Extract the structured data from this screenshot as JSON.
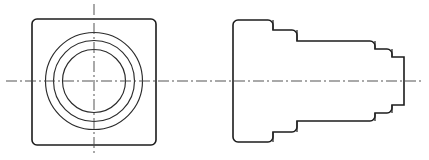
{
  "document": {
    "type": "engineering-drawing",
    "title": "Two-view orthographic projection",
    "description": "Mechanical part drawing: front view with concentric circles and rounded-square body, side view showing stepped cylindrical profile",
    "projection": "third-angle",
    "line_colors": {
      "outline": "#1c1c1c",
      "circle": "#2b2b2b",
      "centerline": "#4a4a4a",
      "background": "#ffffff"
    }
  },
  "views": {
    "front": {
      "name": "front-view",
      "body": {
        "shape": "rounded-square",
        "x": 32,
        "y": 19,
        "width": 124,
        "height": 126,
        "corner_radius": 5
      },
      "circles": [
        {
          "name": "outer-circle",
          "cx": 94,
          "cy": 81,
          "r": 48.5
        },
        {
          "name": "middle-circle",
          "cx": 94,
          "cy": 81,
          "r": 40.5
        },
        {
          "name": "inner-circle",
          "cx": 94,
          "cy": 81,
          "r": 31.5
        }
      ],
      "centerlines": {
        "vertical": {
          "x": 94,
          "y1": 4,
          "y2": 156
        }
      }
    },
    "side": {
      "name": "side-view",
      "axis_y": 81,
      "profile_steps": [
        {
          "name": "flange",
          "x1": 233,
          "x2": 273,
          "half_height": 61
        },
        {
          "name": "shoulder",
          "x1": 273,
          "x2": 297,
          "half_height": 51
        },
        {
          "name": "main-body",
          "x1": 297,
          "x2": 375,
          "half_height": 40
        },
        {
          "name": "step-1",
          "x1": 375,
          "x2": 392,
          "half_height": 32
        },
        {
          "name": "step-2",
          "x1": 392,
          "x2": 404,
          "half_height": 24
        }
      ],
      "flange_corner_radius": 5
    },
    "shared_centerline": {
      "name": "horizontal-centerline",
      "y": 81,
      "x1": 6,
      "x2": 423
    }
  }
}
